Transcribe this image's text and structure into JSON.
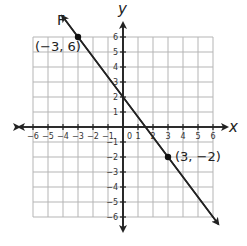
{
  "chart_data": {
    "type": "line",
    "title": "",
    "xlabel": "x",
    "ylabel": "y",
    "xlim": [
      -6,
      6
    ],
    "ylim": [
      -6,
      6
    ],
    "grid": true,
    "x_ticks": [
      "-6",
      "-5",
      "-4",
      "-3",
      "-2",
      "-1",
      "1",
      "2",
      "3",
      "4",
      "5",
      "6"
    ],
    "y_ticks": [
      "6",
      "5",
      "4",
      "3",
      "2",
      "1",
      "-1",
      "-2",
      "-3",
      "-4",
      "-5",
      "-6"
    ],
    "origin_label": "0",
    "series": [
      {
        "name": "F",
        "equation": "y = -4/3 x + 2",
        "points": [
          {
            "x": -3,
            "y": 6,
            "label": "(−3, 6)"
          },
          {
            "x": 3,
            "y": -2,
            "label": "(3, −2)"
          }
        ]
      }
    ]
  },
  "labels": {
    "line_name": "F",
    "x_axis": "x",
    "y_axis": "y",
    "origin": "0",
    "point1": "(−3, 6)",
    "point2": "(3, −2)"
  }
}
